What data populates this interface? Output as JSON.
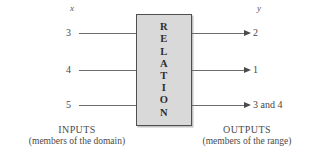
{
  "diagram": {
    "input_variable": "x",
    "output_variable": "y",
    "box_label_letters": [
      "R",
      "E",
      "L",
      "A",
      "T",
      "I",
      "O",
      "N"
    ],
    "box_label": "RELATION",
    "rows": [
      {
        "input": "3",
        "output": "2"
      },
      {
        "input": "4",
        "output": "1"
      },
      {
        "input": "5",
        "output": "3 and 4"
      }
    ],
    "inputs_caption": {
      "title": "INPUTS",
      "subtitle": "(members of the domain)"
    },
    "outputs_caption": {
      "title": "OUTPUTS",
      "subtitle": "(members of the range)"
    },
    "colors": {
      "box_fill": "#d9d9d9",
      "box_border": "#4f4f4f",
      "line": "#6d6d6d",
      "text": "#3b3b3b",
      "background": "#ffffff"
    }
  }
}
